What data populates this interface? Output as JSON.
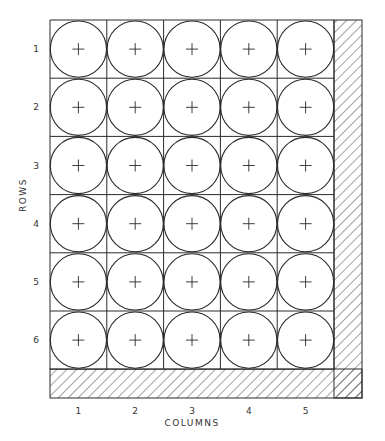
{
  "diagram": {
    "axis_labels": {
      "rows": "ROWS",
      "columns": "COLUMNS"
    },
    "row_labels": [
      "1",
      "2",
      "3",
      "4",
      "5",
      "6"
    ],
    "column_labels": [
      "1",
      "2",
      "3",
      "4",
      "5"
    ],
    "grid": {
      "rows": 6,
      "cols": 5,
      "x0": 50,
      "y0": 20,
      "cell_w": 56.8,
      "cell_h": 58.2
    },
    "cell_marker": "plus-in-circle",
    "colors": {
      "line": "#2a2a2a",
      "background": "#ffffff"
    }
  }
}
